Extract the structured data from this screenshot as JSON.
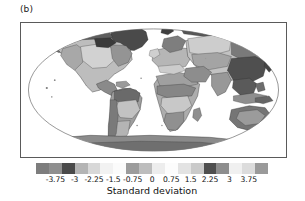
{
  "figure": {
    "panel_label": "(b)",
    "background": "#ffffff"
  },
  "colorbar": {
    "title": "Standard deviation",
    "tick_labels": [
      "-3.75",
      "-3",
      "-2.25",
      "-1.5",
      "-0.75",
      "0",
      "0.75",
      "1.5",
      "2.25",
      "3",
      "3.75"
    ],
    "tick_values": [
      -3.75,
      -3,
      -2.25,
      -1.5,
      -0.75,
      0,
      0.75,
      1.5,
      2.25,
      3,
      3.75
    ],
    "range": [
      -4.5,
      4.5
    ],
    "step": 0.75,
    "colors": [
      "#7d7d7d",
      "#8f8f8f",
      "#4a4a4a",
      "#b4b4b4",
      "#d8d8d8",
      "#f2f2f2",
      "#fbfbfb",
      "#9c9c9c",
      "#bdbdbd",
      "#ededed",
      "#fcfcfc",
      "#e3e3e3",
      "#cacaca",
      "#4f4f4f",
      "#8d8d8d",
      "#f0f0f0",
      "#dcdcdc",
      "#9a9a9a"
    ]
  },
  "chart_data": {
    "type": "heatmap",
    "title": "(b)",
    "subtitle": "",
    "xlabel": "",
    "ylabel": "",
    "colorbar_label": "Standard deviation",
    "projection": "robinson",
    "grid": false,
    "legend": "bottom-horizontal-colorbar",
    "colormap": "greys-discrete",
    "vmin": -4.5,
    "vmax": 4.5,
    "level_step": 0.75,
    "levels": [
      -4.5,
      -3.75,
      -3,
      -2.25,
      -1.5,
      -0.75,
      0,
      0.75,
      1.5,
      2.25,
      3,
      3.75,
      4.5
    ],
    "tick_labels": [
      "-3.75",
      "-3",
      "-2.25",
      "-1.5",
      "-0.75",
      "0",
      "0.75",
      "1.5",
      "2.25",
      "3",
      "3.75"
    ],
    "ocean_value": null,
    "regions": [
      {
        "name": "Greenland",
        "value": 3.2,
        "shade": "#4a4a4a"
      },
      {
        "name": "Arctic Canada",
        "value": 2.6,
        "shade": "#5e5e5e"
      },
      {
        "name": "Alaska",
        "value": 2.1,
        "shade": "#6f6f6f"
      },
      {
        "name": "Western North America",
        "value": 1.2,
        "shade": "#a8a8a8"
      },
      {
        "name": "Central North America",
        "value": 0.7,
        "shade": "#c9c9c9"
      },
      {
        "name": "Eastern North America",
        "value": 1.6,
        "shade": "#949494"
      },
      {
        "name": "Central America",
        "value": 1.9,
        "shade": "#8a8a8a"
      },
      {
        "name": "Northern South America",
        "value": 2.4,
        "shade": "#6a6a6a"
      },
      {
        "name": "Amazon Basin",
        "value": 1.5,
        "shade": "#9e9e9e"
      },
      {
        "name": "Southern South America",
        "value": 0.9,
        "shade": "#bdbdbd"
      },
      {
        "name": "Northern Africa / Sahara",
        "value": 1.4,
        "shade": "#a0a0a0"
      },
      {
        "name": "Sahel",
        "value": 2.0,
        "shade": "#868686"
      },
      {
        "name": "Central Africa",
        "value": 1.1,
        "shade": "#adadad"
      },
      {
        "name": "Southern Africa",
        "value": 1.7,
        "shade": "#909090"
      },
      {
        "name": "Europe",
        "value": 1.0,
        "shade": "#b6b6b6"
      },
      {
        "name": "Middle East",
        "value": 1.8,
        "shade": "#8d8d8d"
      },
      {
        "name": "Western Siberia",
        "value": 0.8,
        "shade": "#c2c2c2"
      },
      {
        "name": "Central Asia",
        "value": 1.3,
        "shade": "#a4a4a4"
      },
      {
        "name": "Eastern Siberia",
        "value": 2.2,
        "shade": "#7a7a7a"
      },
      {
        "name": "East Asia / China",
        "value": 3.0,
        "shade": "#4f4f4f"
      },
      {
        "name": "Southeast Asia",
        "value": 2.8,
        "shade": "#5a5a5a"
      },
      {
        "name": "India",
        "value": 1.6,
        "shade": "#989898"
      },
      {
        "name": "Australia",
        "value": 2.3,
        "shade": "#757575"
      },
      {
        "name": "New Zealand",
        "value": 1.5,
        "shade": "#9b9b9b"
      },
      {
        "name": "Antarctica",
        "value": 1.9,
        "shade": "#8b8b8b"
      }
    ]
  }
}
